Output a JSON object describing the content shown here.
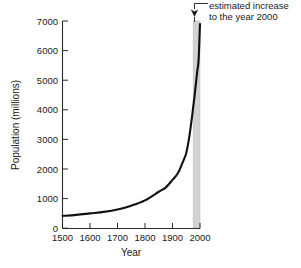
{
  "chart_data": {
    "type": "line",
    "title": "",
    "xlabel": "Year",
    "ylabel": "Population (millions)",
    "xlim": [
      1500,
      2000
    ],
    "ylim": [
      0,
      7000
    ],
    "grid": false,
    "legend": false,
    "x_ticks": [
      1500,
      1600,
      1700,
      1800,
      1900,
      2000
    ],
    "x_tick_labels": [
      "1500",
      "1600",
      "1700",
      "1800",
      "1900",
      "2000"
    ],
    "y_ticks": [
      0,
      1000,
      2000,
      3000,
      4000,
      5000,
      6000,
      7000
    ],
    "y_tick_labels": [
      "0",
      "1000",
      "2000",
      "3000",
      "4000",
      "5000",
      "6000",
      "7000"
    ],
    "series": [
      {
        "name": "World population",
        "x": [
          1500,
          1550,
          1600,
          1650,
          1700,
          1750,
          1800,
          1850,
          1875,
          1900,
          1920,
          1940,
          1950,
          1960,
          1970,
          1975,
          1980,
          1990,
          1995,
          2000
        ],
        "values": [
          425,
          460,
          510,
          560,
          640,
          770,
          950,
          1240,
          1380,
          1640,
          1870,
          2300,
          2550,
          3030,
          3700,
          4080,
          4450,
          5300,
          5700,
          6900
        ]
      }
    ],
    "shaded_region": {
      "name": "estimated-increase-band",
      "x_start": 1975,
      "x_end": 2000,
      "color": "#d2d2d2"
    },
    "annotations": [
      {
        "name": "estimated-increase-callout",
        "line1": "estimated increase",
        "line2": "to the year 2000",
        "points_to_x": 2000,
        "points_to_y": 7000
      }
    ]
  },
  "colors": {
    "curve": "#111111",
    "axis": "#2b2b2b",
    "band": "#d2d2d2",
    "background": "#ffffff"
  },
  "caption": {
    "cropped_text": ""
  }
}
